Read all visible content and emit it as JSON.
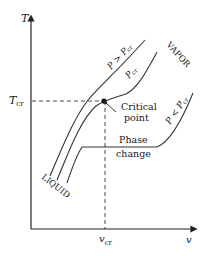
{
  "diagram": {
    "type": "T-v phase diagram",
    "axes": {
      "y_label": "T",
      "x_label": "v",
      "y_marker": {
        "main": "T",
        "sub": "cr"
      },
      "x_marker": {
        "main": "v",
        "sub": "cr"
      }
    },
    "curves": [
      {
        "id": "above-critical",
        "label_main": "P > P",
        "label_sub": "cr"
      },
      {
        "id": "critical",
        "label_main": "P",
        "label_sub": "cr"
      },
      {
        "id": "below-critical",
        "label_main": "P < P",
        "label_sub": "cr"
      }
    ],
    "regions": {
      "vapor": "VAPOR",
      "liquid": "LIQUID"
    },
    "annotations": {
      "critical_point_line1": "Critical",
      "critical_point_line2": "point",
      "phase_change_line1": "Phase",
      "phase_change_line2": "change"
    },
    "colors": {
      "ink": "#1a1a1a",
      "background": "#ffffff"
    }
  }
}
